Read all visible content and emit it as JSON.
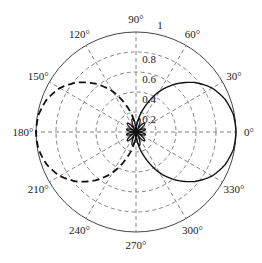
{
  "chart_data": {
    "type": "polar",
    "title": "",
    "center_px": [
      136,
      132
    ],
    "radius_px": 100,
    "rlim": [
      0,
      1
    ],
    "radial_ticks": [
      0.2,
      0.4,
      0.6,
      0.8,
      1
    ],
    "radial_tick_labels": [
      "0.2",
      "0.4",
      "0.6",
      "0.8",
      "1"
    ],
    "radial_label_angle_deg": 90,
    "angular_ticks_deg": [
      0,
      30,
      60,
      90,
      120,
      150,
      180,
      210,
      240,
      270,
      300,
      330
    ],
    "angular_tick_labels": [
      "0°",
      "30°",
      "60°",
      "90°",
      "120°",
      "150°",
      "180°",
      "210°",
      "240°",
      "270°",
      "300°",
      "330°"
    ],
    "grid": true,
    "grid_style": "dashed",
    "series": [
      {
        "name": "main lobe (solid)",
        "style": "solid",
        "theta_deg": [
          -90,
          -80,
          -70,
          -60,
          -50,
          -40,
          -30,
          -20,
          -10,
          0,
          10,
          20,
          30,
          40,
          50,
          60,
          70,
          80,
          90
        ],
        "r": [
          0.0,
          0.12,
          0.28,
          0.47,
          0.63,
          0.77,
          0.88,
          0.95,
          0.99,
          1.0,
          0.99,
          0.95,
          0.88,
          0.77,
          0.63,
          0.47,
          0.28,
          0.12,
          0.0
        ]
      },
      {
        "name": "back lobe (dashed)",
        "style": "dashed",
        "theta_deg": [
          90,
          100,
          110,
          120,
          130,
          140,
          150,
          160,
          170,
          180,
          190,
          200,
          210,
          220,
          230,
          240,
          250,
          260,
          270
        ],
        "r": [
          0.0,
          0.12,
          0.28,
          0.47,
          0.63,
          0.77,
          0.88,
          0.95,
          0.99,
          1.0,
          0.99,
          0.95,
          0.88,
          0.77,
          0.63,
          0.47,
          0.28,
          0.12,
          0.0
        ]
      },
      {
        "name": "side lobes (center)",
        "style": "solid",
        "petals": 12,
        "max_r": 0.14
      }
    ]
  }
}
